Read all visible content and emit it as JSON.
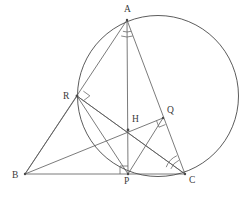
{
  "figure": {
    "width": 247,
    "height": 199,
    "background_color": "#ffffff",
    "stroke_color": "#595959",
    "circle_stroke_color": "#4a4a4a",
    "label_color": "#3a3a3a",
    "stroke_width": 0.8
  },
  "circle": {
    "name": "circumcircle",
    "cx": 158,
    "cy": 96,
    "r": 80.5
  },
  "points": {
    "A": {
      "label": "A",
      "x": 127,
      "y": 20,
      "label_x": 124,
      "label_y": 12
    },
    "B": {
      "label": "B",
      "x": 25,
      "y": 174,
      "label_x": 12,
      "label_y": 178
    },
    "C": {
      "label": "C",
      "x": 185,
      "y": 174,
      "label_x": 189,
      "label_y": 183
    },
    "P": {
      "label": "P",
      "x": 128,
      "y": 174,
      "label_x": 124,
      "label_y": 184
    },
    "Q": {
      "label": "Q",
      "x": 163,
      "y": 118,
      "label_x": 167,
      "label_y": 113
    },
    "R": {
      "label": "R",
      "x": 77,
      "y": 96,
      "label_x": 63,
      "label_y": 99
    },
    "H": {
      "label": "H",
      "x": 128,
      "y": 130,
      "label_x": 132,
      "label_y": 122
    }
  },
  "segments": [
    {
      "name": "segment-AB",
      "from": "A",
      "to": "B",
      "x1": 127,
      "y1": 20,
      "x2": 25,
      "y2": 174
    },
    {
      "name": "segment-AC",
      "from": "A",
      "to": "C",
      "x1": 127,
      "y1": 20,
      "x2": 185,
      "y2": 174
    },
    {
      "name": "segment-BC",
      "from": "B",
      "to": "C",
      "x1": 25,
      "y1": 174,
      "x2": 185,
      "y2": 174
    },
    {
      "name": "altitude-AP",
      "from": "A",
      "to": "P",
      "x1": 127,
      "y1": 20,
      "x2": 128,
      "y2": 174
    },
    {
      "name": "altitude-BQ",
      "from": "B",
      "to": "Q",
      "x1": 25,
      "y1": 174,
      "x2": 163,
      "y2": 118
    },
    {
      "name": "altitude-CR",
      "from": "C",
      "to": "R",
      "x1": 185,
      "y1": 174,
      "x2": 77,
      "y2": 96
    },
    {
      "name": "segment-RP",
      "from": "R",
      "to": "P",
      "x1": 77,
      "y1": 96,
      "x2": 128,
      "y2": 174
    },
    {
      "name": "segment-RC",
      "from": "R",
      "to": "C",
      "x1": 77,
      "y1": 96,
      "x2": 185,
      "y2": 174
    },
    {
      "name": "segment-PQ",
      "from": "P",
      "to": "Q",
      "x1": 128,
      "y1": 174,
      "x2": 163,
      "y2": 118
    },
    {
      "name": "segment-RB",
      "from": "R",
      "to": "B",
      "x1": 77,
      "y1": 96,
      "x2": 25,
      "y2": 174
    }
  ],
  "right_angle_marks": [
    {
      "name": "right-angle-at-P",
      "vertex": "P",
      "x": 128,
      "y": 174,
      "dir1": [
        0,
        -1
      ],
      "dir2": [
        -1,
        0
      ],
      "size": 8
    },
    {
      "name": "right-angle-at-R",
      "vertex": "R",
      "x": 77,
      "y": 96,
      "dir1": [
        0.794,
        -0.608
      ],
      "dir2": [
        0.811,
        0.585
      ],
      "size": 8
    },
    {
      "name": "right-angle-at-Q",
      "vertex": "Q",
      "x": 163,
      "y": 118,
      "dir1": [
        -0.927,
        0.375
      ],
      "dir2": [
        0.352,
        0.936
      ],
      "size": 7
    }
  ],
  "angle_arcs": [
    {
      "name": "angle-arc-at-A",
      "vertex": "A",
      "x": 127,
      "y": 20,
      "radius": 17,
      "start_deg": 70,
      "end_deg": 110
    },
    {
      "name": "angle-arc-at-C",
      "vertex": "C",
      "x": 185,
      "y": 174,
      "radius": 20,
      "start_deg": 200,
      "end_deg": 246
    }
  ],
  "labels_order": [
    "A",
    "R",
    "Q",
    "H",
    "B",
    "P",
    "C"
  ]
}
